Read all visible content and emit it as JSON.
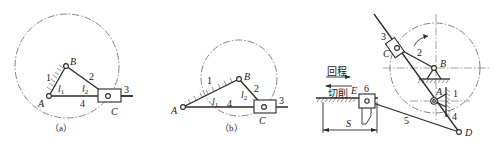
{
  "figure": {
    "panels": [
      {
        "id": "a",
        "caption": "（a）",
        "points": {
          "A": "A",
          "B": "B",
          "C": "C"
        },
        "link_numbers": [
          "1",
          "2",
          "3",
          "4"
        ],
        "lengths": {
          "l1": "l",
          "l1_sub": "1",
          "l2": "l",
          "l2_sub": "2"
        }
      },
      {
        "id": "b",
        "caption": "（b）",
        "points": {
          "A": "A",
          "B": "B",
          "C": "C"
        },
        "link_numbers": [
          "1",
          "2",
          "3",
          "4"
        ],
        "lengths": {
          "l1": "l",
          "l1_sub": "1",
          "l2": "l",
          "l2_sub": "2"
        }
      },
      {
        "id": "c",
        "points": {
          "A": "A",
          "B": "B",
          "C": "C",
          "D": "D",
          "E": "E"
        },
        "link_numbers": [
          "1",
          "2",
          "3",
          "4",
          "5",
          "6"
        ],
        "motion_labels": {
          "return": "回程",
          "cutting": "切削"
        },
        "dimension": "S"
      }
    ]
  }
}
